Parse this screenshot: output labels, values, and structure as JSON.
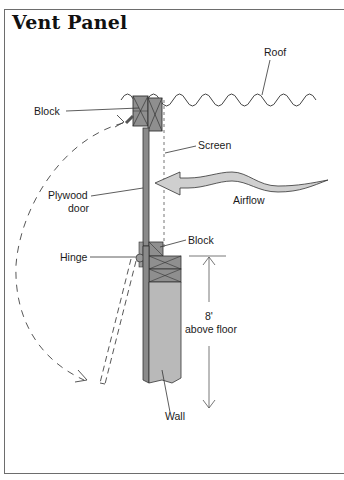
{
  "title": "Vent Panel",
  "labels": {
    "roof": "Roof",
    "block_top": "Block",
    "screen": "Screen",
    "plywood_line1": "Plywood",
    "plywood_line2": "door",
    "airflow": "Airflow",
    "block_bottom": "Block",
    "hinge": "Hinge",
    "height_line1": "8'",
    "height_line2": "above floor",
    "wall": "Wall"
  },
  "colors": {
    "frame": "#6d6d6d",
    "block_fill": "#8f8f8f",
    "door_fill": "#8a8a8a",
    "wall_fill": "#b9b9b9",
    "wall_side": "#8c8c8c",
    "airflow_fill": "#cfcfcf",
    "line": "#333333"
  }
}
